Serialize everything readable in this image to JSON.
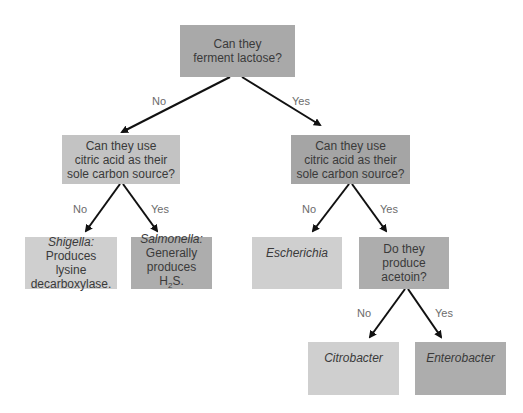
{
  "nodes": {
    "root": {
      "text": "Can they ferment lactose?",
      "line1": "Can they",
      "line2": "ferment lactose?"
    },
    "left_q": {
      "line1": "Can they use",
      "line2": "citric acid as their",
      "line3": "sole carbon source?"
    },
    "right_q": {
      "line1": "Can they use",
      "line2": "citric acid as their",
      "line3": "sole carbon source?"
    },
    "shigella": {
      "genus": "Shigella",
      "line2": "Produces lysine",
      "line3": "decarboxylase."
    },
    "salmonella": {
      "genus": "Salmonella",
      "line2": "Generally",
      "line3_pre": "produces H",
      "sub": "2",
      "line3_post": "S."
    },
    "escherichia": {
      "genus": "Escherichia"
    },
    "acetoin_q": {
      "line1": "Do they",
      "line2": "produce",
      "line3": "acetoin?"
    },
    "citrobacter": {
      "genus": "Citrobacter"
    },
    "enterobacter": {
      "genus": "Enterobacter"
    }
  },
  "edge_labels": {
    "root_no": "No",
    "root_yes": "Yes",
    "left_no": "No",
    "left_yes": "Yes",
    "right_no": "No",
    "right_yes": "Yes",
    "acetoin_no": "No",
    "acetoin_yes": "Yes"
  },
  "colors": {
    "arrow": "#111111",
    "label": "#6b6b6b"
  }
}
